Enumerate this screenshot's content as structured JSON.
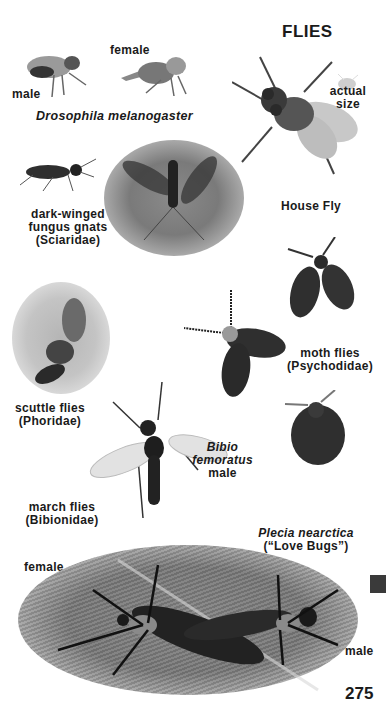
{
  "page": {
    "title": "FLIES",
    "page_number": "275"
  },
  "drosophila": {
    "male_label": "male",
    "female_label": "female",
    "species": "Drosophila melanogaster"
  },
  "house_fly": {
    "name": "House Fly",
    "actual_size_line1": "actual",
    "actual_size_line2": "size"
  },
  "fungus_gnats": {
    "line1": "dark-winged",
    "line2": "fungus gnats",
    "line3": "(Sciaridae)"
  },
  "moth_flies": {
    "line1": "moth flies",
    "line2": "(Psychodidae)"
  },
  "scuttle_flies": {
    "line1": "scuttle flies",
    "line2": "(Phoridae)"
  },
  "bibio": {
    "line1": "Bibio",
    "line2": "femoratus",
    "line3": "male"
  },
  "march_flies": {
    "line1": "march flies",
    "line2": "(Bibionidae)"
  },
  "love_bugs": {
    "species": "Plecia nearctica",
    "common": "(“Love Bugs”)",
    "female_label": "female",
    "male_label": "male"
  },
  "colors": {
    "text": "#1a1a1a",
    "tab": "#3a3a3a",
    "background": "#ffffff"
  }
}
